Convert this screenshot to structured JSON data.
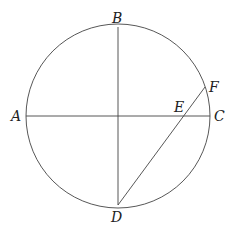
{
  "diagram": {
    "circle": {
      "cx": 118,
      "cy": 116,
      "r": 92
    },
    "segments": [
      {
        "name": "AC",
        "x1": 26,
        "y1": 116,
        "x2": 210,
        "y2": 116
      },
      {
        "name": "BD",
        "x1": 118,
        "y1": 27,
        "x2": 118,
        "y2": 205
      },
      {
        "name": "DF",
        "x1": 118,
        "y1": 205,
        "x2": 205,
        "y2": 87
      }
    ],
    "labels": {
      "A": {
        "text": "A",
        "x": 11,
        "y": 121
      },
      "B": {
        "text": "B",
        "x": 112,
        "y": 23
      },
      "C": {
        "text": "C",
        "x": 214,
        "y": 121
      },
      "D": {
        "text": "D",
        "x": 111,
        "y": 222
      },
      "E": {
        "text": "E",
        "x": 174,
        "y": 112
      },
      "F": {
        "text": "F",
        "x": 209,
        "y": 92
      }
    }
  }
}
